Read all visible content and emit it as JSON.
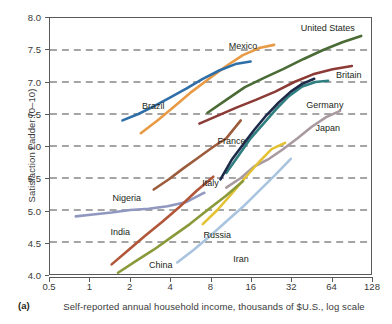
{
  "figure": {
    "panel_letter": "(a)",
    "xlabel": "Self-reported annual household income, thousands of $U.S., log scale",
    "ylabel": "Satisfaction Ladder (0–10)"
  },
  "chart_data": {
    "type": "line",
    "title": "",
    "xlabel": "Self-reported annual household income, thousands of $U.S., log scale",
    "ylabel": "Satisfaction Ladder (0–10)",
    "xscale": "log",
    "xlim": [
      0.5,
      128
    ],
    "ylim": [
      4.0,
      8.0
    ],
    "grid": "horizontal-dashed",
    "legend": "inline-labels",
    "xticks": [
      "0.5",
      "1",
      "2",
      "4",
      "8",
      "16",
      "32",
      "64",
      "128"
    ],
    "xtick_values": [
      0.5,
      1,
      2,
      4,
      8,
      16,
      32,
      64,
      128
    ],
    "yticks": [
      "4.0",
      "4.5",
      "5.0",
      "5.5",
      "6.0",
      "6.5",
      "7.0",
      "7.5",
      "8.0"
    ],
    "ytick_values": [
      4.0,
      4.5,
      5.0,
      5.5,
      6.0,
      6.5,
      7.0,
      7.5,
      8.0
    ],
    "series": [
      {
        "name": "United States",
        "color": "#4a6b36",
        "label_x": 60.0,
        "label_y": 7.83,
        "x": [
          7.6,
          10.5,
          14.5,
          20.0,
          28.0,
          40.0,
          56.0,
          78.0,
          108.0
        ],
        "y": [
          6.52,
          6.72,
          6.92,
          7.06,
          7.2,
          7.36,
          7.5,
          7.62,
          7.72
        ]
      },
      {
        "name": "Britain",
        "color": "#8c3b36",
        "label_x": 86.0,
        "label_y": 7.1,
        "x": [
          6.6,
          9.0,
          12.5,
          17.5,
          24.5,
          34.0,
          47.0,
          66.0,
          92.0
        ],
        "y": [
          6.35,
          6.47,
          6.6,
          6.72,
          6.85,
          7.0,
          7.12,
          7.2,
          7.25
        ]
      },
      {
        "name": "Germany",
        "color": "#2f7e80",
        "label_x": 57.0,
        "label_y": 6.63,
        "x": [
          10.5,
          13.0,
          16.0,
          20.0,
          25.0,
          31.0,
          39.0,
          49.0,
          61.0
        ],
        "y": [
          5.58,
          5.85,
          6.12,
          6.35,
          6.58,
          6.78,
          6.93,
          7.0,
          7.02
        ]
      },
      {
        "name": "Japan",
        "color": "#a89aa0",
        "label_x": 60.0,
        "label_y": 6.28,
        "x": [
          10.5,
          13.5,
          17.0,
          22.0,
          28.0,
          36.0,
          46.0,
          59.0,
          75.0
        ],
        "y": [
          5.35,
          5.5,
          5.68,
          5.8,
          5.95,
          6.12,
          6.3,
          6.45,
          6.55
        ]
      },
      {
        "name": "France",
        "color": "#1e2a4a",
        "label_x": 11.5,
        "label_y": 6.07,
        "x": [
          9.5,
          11.5,
          14.0,
          17.0,
          21.0,
          26.0,
          32.0,
          39.0,
          48.0
        ],
        "y": [
          5.48,
          5.78,
          6.02,
          6.25,
          6.48,
          6.68,
          6.85,
          6.97,
          7.05
        ]
      },
      {
        "name": "Mexico",
        "color": "#e89a45",
        "label_x": 14.0,
        "label_y": 7.55,
        "x": [
          2.4,
          3.2,
          4.3,
          5.8,
          7.8,
          10.5,
          14.0,
          18.5,
          24.0
        ],
        "y": [
          6.2,
          6.4,
          6.62,
          6.85,
          7.05,
          7.25,
          7.42,
          7.53,
          7.58
        ]
      },
      {
        "name": "Brazil",
        "color": "#2f6fa8",
        "label_x": 3.0,
        "label_y": 6.62,
        "x": [
          1.75,
          2.3,
          3.0,
          4.0,
          5.3,
          7.0,
          9.3,
          12.3,
          16.0
        ],
        "y": [
          6.4,
          6.5,
          6.62,
          6.76,
          6.9,
          7.05,
          7.18,
          7.28,
          7.32
        ]
      },
      {
        "name": "Italy",
        "color": "#9c5c3c",
        "label_x": 8.0,
        "label_y": 5.42,
        "x": [
          3.0,
          3.9,
          5.0,
          6.5,
          8.3,
          10.5,
          13.5
        ],
        "y": [
          5.32,
          5.48,
          5.65,
          5.82,
          5.98,
          6.12,
          6.4
        ]
      },
      {
        "name": "Russia",
        "color": "#e3c233",
        "label_x": 9.0,
        "label_y": 4.62,
        "x": [
          7.0,
          9.0,
          11.5,
          14.5,
          18.5,
          23.0,
          29.0
        ],
        "y": [
          4.78,
          5.0,
          5.25,
          5.5,
          5.75,
          5.95,
          6.05
        ]
      },
      {
        "name": "Iran",
        "color": "#a9c4de",
        "label_x": 13.5,
        "label_y": 4.25,
        "x": [
          4.5,
          6.0,
          8.0,
          10.5,
          14.0,
          18.5,
          24.5,
          32.0
        ],
        "y": [
          4.18,
          4.38,
          4.6,
          4.82,
          5.05,
          5.3,
          5.55,
          5.8
        ]
      },
      {
        "name": "Nigeria",
        "color": "#9098c0",
        "label_x": 1.9,
        "label_y": 5.2,
        "x": [
          0.78,
          1.05,
          1.45,
          2.0,
          2.75,
          3.8,
          5.2,
          7.2
        ],
        "y": [
          4.9,
          4.93,
          4.96,
          5.0,
          5.02,
          5.06,
          5.12,
          5.27
        ]
      },
      {
        "name": "India",
        "color": "#b2563a",
        "label_x": 1.7,
        "label_y": 4.66,
        "x": [
          1.45,
          1.95,
          2.6,
          3.5,
          4.7,
          6.3,
          8.4
        ],
        "y": [
          4.15,
          4.38,
          4.6,
          4.82,
          5.05,
          5.3,
          5.52
        ]
      },
      {
        "name": "China",
        "color": "#8a9a3b",
        "label_x": 3.4,
        "label_y": 4.15,
        "x": [
          1.62,
          2.2,
          3.0,
          4.1,
          5.6,
          7.6,
          10.4,
          14.0
        ],
        "y": [
          4.02,
          4.2,
          4.38,
          4.58,
          4.78,
          5.0,
          5.22,
          5.45
        ]
      }
    ]
  }
}
